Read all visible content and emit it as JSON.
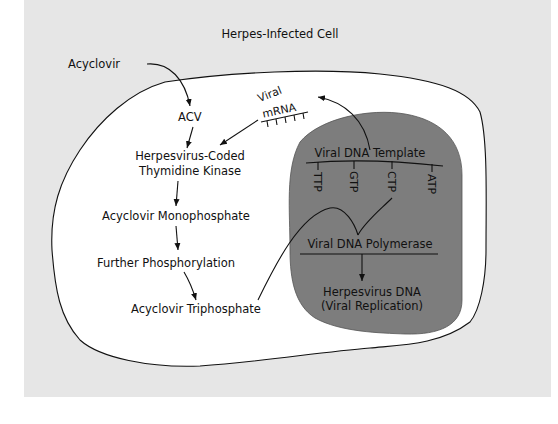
{
  "title": "Herpes-Infected Cell",
  "colors": {
    "background": "#e6e6e6",
    "cell": "#ffffff",
    "nucleus": "#7d7d7d",
    "line": "#111111"
  },
  "labels": {
    "acyclovir": "Acyclovir",
    "acv": "ACV",
    "viral": "Viral",
    "mrna": "mRNA",
    "tk_line1": "Herpesvirus-Coded",
    "tk_line2": "Thymidine Kinase",
    "monophosphate": "Acyclovir Monophosphate",
    "further": "Further Phosphorylation",
    "triphosphate": "Acyclovir Triphosphate",
    "template": "Viral DNA Template",
    "nucleotides": [
      "TTP",
      "GTP",
      "CTP",
      "ATP"
    ],
    "polymerase": "Viral DNA Polymerase",
    "dna_line1": "Herpesvirus DNA",
    "dna_line2": "(Viral Replication)"
  }
}
